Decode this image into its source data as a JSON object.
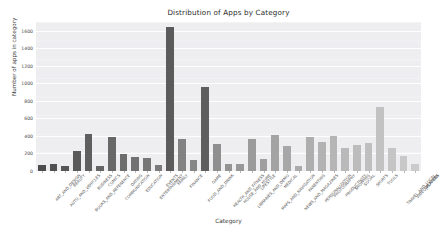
{
  "chart_data": {
    "type": "bar",
    "title": "Distribution of Apps by Category",
    "xlabel": "Category",
    "ylabel": "Number of apps in category",
    "ylim": [
      0,
      1700
    ],
    "yticks": [
      0,
      200,
      400,
      600,
      800,
      1000,
      1200,
      1400,
      1600
    ],
    "grid": true,
    "legend": "none",
    "categories": [
      "ART_AND_DESIGN",
      "AUTO_AND_VEHICLES",
      "BEAUTY",
      "BOOKS_AND_REFERENCE",
      "BUSINESS",
      "COMICS",
      "COMMUNICATION",
      "DATING",
      "EDUCATION",
      "ENTERTAINMENT",
      "EVENTS",
      "FAMILY",
      "FINANCE",
      "FOOD_AND_DRINK",
      "GAME",
      "HEALTH_AND_FITNESS",
      "HOUSE_AND_HOME",
      "LIBRARIES_AND_DEMO",
      "LIFESTYLE",
      "MAPS_AND_NAVIGATION",
      "MEDICAL",
      "NEWS_AND_MAGAZINES",
      "PARENTING",
      "PERSONALIZATION",
      "PHOTOGRAPHY",
      "PRODUCTIVITY",
      "SHOPPING",
      "SOCIAL",
      "SPORTS",
      "TOOLS",
      "TRAVEL_AND_LOCAL",
      "VIDEO_PLAYERS",
      "WEATHER"
    ],
    "values": [
      65,
      85,
      53,
      231,
      420,
      60,
      387,
      195,
      156,
      149,
      64,
      1642,
      360,
      127,
      960,
      307,
      80,
      85,
      370,
      137,
      408,
      283,
      60,
      392,
      335,
      394,
      260,
      295,
      325,
      730,
      258,
      175,
      82
    ],
    "bar_colors": [
      "#4c4c4c",
      "#515151",
      "#565656",
      "#5a5a5a",
      "#5f5f5f",
      "#646464",
      "#686868",
      "#6d6d6d",
      "#717171",
      "#767676",
      "#7a7a7a",
      "#5b5b5b",
      "#828282",
      "#868686",
      "#5e5e5e",
      "#8f8f8f",
      "#939393",
      "#979797",
      "#9b9b9b",
      "#9f9f9f",
      "#a3a3a3",
      "#a7a7a7",
      "#ababab",
      "#aeaeae",
      "#b2b2b2",
      "#b5b5b5",
      "#b9b9b9",
      "#bcbcbc",
      "#bfbfbf",
      "#c2c2c2",
      "#c5c5c5",
      "#c8c8c8",
      "#cbcbcb"
    ]
  },
  "style": {
    "plot_background": "#eaeaf0",
    "gridline_color": "#ffffff",
    "text_color": "#3c3c3c",
    "figure_background": "#ffffff"
  }
}
